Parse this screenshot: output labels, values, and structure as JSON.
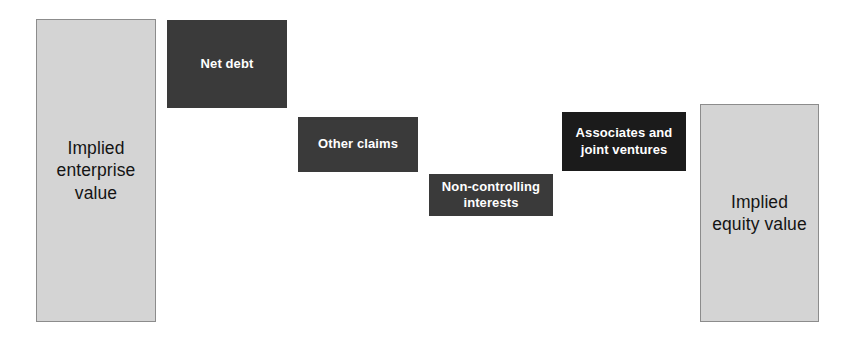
{
  "chart_data": {
    "type": "bar",
    "title": "",
    "subtitle": "",
    "xlabel": "",
    "ylabel": "",
    "grid": false,
    "legend": null,
    "orientation": "vertical",
    "style": "waterfall bridge from implied enterprise value to implied equity value",
    "categories": [
      "Implied enterprise value",
      "Net debt",
      "Other claims",
      "Non-controlling interests",
      "Associates and joint ventures",
      "Implied equity value"
    ],
    "bars": [
      {
        "label": "Implied\nenterprise\nvalue",
        "label_plain": "Implied enterprise value",
        "kind": "total",
        "role": "starting total",
        "x": 36,
        "y": 19,
        "width": 120,
        "height": 303,
        "top_value": 303,
        "bottom_value": 0,
        "magnitude": 303,
        "fill": "#d4d4d4",
        "border": "#8c8c8c",
        "text_color": "#141414"
      },
      {
        "label": "Net debt",
        "label_plain": "Net debt",
        "kind": "deduction",
        "role": "subtracted step",
        "x": 167,
        "y": 20,
        "width": 120,
        "height": 88,
        "top_value": 302,
        "bottom_value": 214,
        "magnitude": 88,
        "fill": "#3a3a3a",
        "border": "none",
        "text_color": "#ffffff"
      },
      {
        "label": "Other claims",
        "label_plain": "Other claims",
        "kind": "deduction",
        "role": "subtracted step",
        "x": 298,
        "y": 117,
        "width": 120,
        "height": 55,
        "top_value": 205,
        "bottom_value": 150,
        "magnitude": 55,
        "fill": "#3a3a3a",
        "border": "none",
        "text_color": "#ffffff"
      },
      {
        "label": "Non-controlling\ninterests",
        "label_plain": "Non-controlling interests",
        "kind": "deduction",
        "role": "subtracted step",
        "x": 429,
        "y": 174,
        "width": 124,
        "height": 42,
        "top_value": 148,
        "bottom_value": 106,
        "magnitude": 42,
        "fill": "#3a3a3a",
        "border": "none",
        "text_color": "#ffffff"
      },
      {
        "label": "Associates and\njoint ventures",
        "label_plain": "Associates and joint ventures",
        "kind": "deduction",
        "role": "added step",
        "x": 562,
        "y": 112,
        "width": 124,
        "height": 59,
        "top_value": 210,
        "bottom_value": 151,
        "magnitude": 59,
        "fill": "#1b1b1b",
        "border": "none",
        "text_color": "#ffffff"
      },
      {
        "label": "Implied\nequity value",
        "label_plain": "Implied equity value",
        "kind": "total",
        "role": "ending total",
        "x": 700,
        "y": 104,
        "width": 119,
        "height": 218,
        "top_value": 218,
        "bottom_value": 0,
        "magnitude": 218,
        "fill": "#d4d4d4",
        "border": "#8c8c8c",
        "text_color": "#141414"
      }
    ],
    "values": [
      303,
      88,
      55,
      42,
      59,
      218
    ],
    "ylim": [
      0,
      347
    ],
    "baseline": 322
  }
}
